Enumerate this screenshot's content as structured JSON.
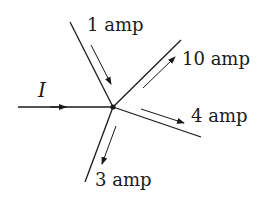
{
  "diagram": {
    "junction": {
      "x": 113,
      "y": 107
    },
    "colors": {
      "line": "#1a1a1a",
      "background": "#ffffff"
    },
    "branches": [
      {
        "id": "input",
        "label": "I",
        "direction": "in"
      },
      {
        "id": "top",
        "label": "1 amp",
        "direction": "in"
      },
      {
        "id": "upper-right",
        "label": "10 amp",
        "direction": "out"
      },
      {
        "id": "right",
        "label": "4 amp",
        "direction": "out"
      },
      {
        "id": "bottom",
        "label": "3 amp",
        "direction": "out"
      }
    ]
  }
}
